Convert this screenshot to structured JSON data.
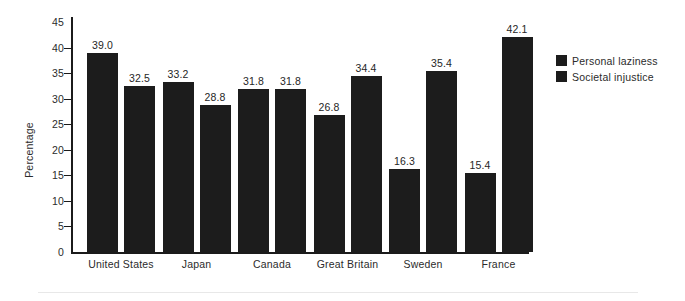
{
  "chart_data": {
    "type": "bar",
    "title": "",
    "xlabel": "",
    "ylabel": "Percentage",
    "ylim": [
      0,
      45
    ],
    "ytick_step": 5,
    "yticks": [
      "0",
      "5",
      "10",
      "15",
      "20",
      "25",
      "30",
      "35",
      "40",
      "45"
    ],
    "grid": false,
    "legend_position": "right",
    "categories": [
      "United States",
      "Japan",
      "Canada",
      "Great Britain",
      "Sweden",
      "France"
    ],
    "series": [
      {
        "name": "Personal laziness",
        "color": "#1c1c1c",
        "values": [
          39.0,
          33.2,
          31.8,
          26.8,
          16.3,
          15.4
        ],
        "labels": [
          "39.0",
          "33.2",
          "31.8",
          "26.8",
          "16.3",
          "15.4"
        ]
      },
      {
        "name": "Societal injustice",
        "color": "#1c1c1c",
        "values": [
          32.5,
          28.8,
          31.8,
          34.4,
          35.4,
          42.1
        ],
        "labels": [
          "32.5",
          "28.8",
          "31.8",
          "34.4",
          "35.4",
          "42.1"
        ]
      }
    ]
  },
  "legend": {
    "items": [
      {
        "label": "Personal laziness",
        "color": "#1c1c1c"
      },
      {
        "label": "Societal injustice",
        "color": "#1c1c1c"
      }
    ]
  }
}
